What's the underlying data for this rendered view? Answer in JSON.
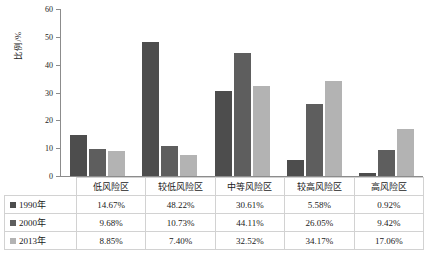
{
  "chart_data": {
    "type": "bar",
    "title": "",
    "xlabel": "",
    "ylabel": "比例/%",
    "ylim": [
      0,
      60
    ],
    "yticks": [
      60,
      50,
      40,
      30,
      20,
      10,
      0
    ],
    "grid": false,
    "legend_position": "table-row-headers",
    "categories": [
      "低风险区",
      "较低风险区",
      "中等风险区",
      "较高风险区",
      "高风险区"
    ],
    "series": [
      {
        "name": "1990年",
        "color": "#4d4d4d",
        "values": [
          14.67,
          48.22,
          30.61,
          5.58,
          0.92
        ],
        "labels": [
          "14.67%",
          "48.22%",
          "30.61%",
          "5.58%",
          "0.92%"
        ]
      },
      {
        "name": "2000年",
        "color": "#5e5e5e",
        "values": [
          9.68,
          10.73,
          44.11,
          26.05,
          9.42
        ],
        "labels": [
          "9.68%",
          "10.73%",
          "44.11%",
          "26.05%",
          "9.42%"
        ]
      },
      {
        "name": "2013年",
        "color": "#b3b3b3",
        "values": [
          8.85,
          7.4,
          32.52,
          34.17,
          17.06
        ],
        "labels": [
          "8.85%",
          "7.40%",
          "32.52%",
          "34.17%",
          "17.06%"
        ]
      }
    ]
  }
}
